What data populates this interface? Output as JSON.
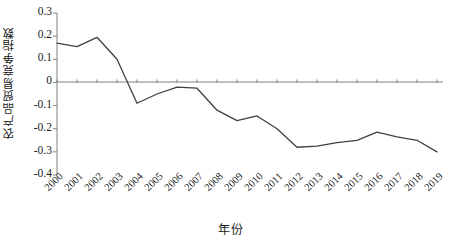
{
  "chart_data": {
    "type": "line",
    "title": "",
    "subtitle": "",
    "xlabel": "年份",
    "ylabel": "农产品贸易竞争指数",
    "legend": [],
    "legend_position": "none",
    "grid": false,
    "xlim": [
      2000,
      2019
    ],
    "ylim": [
      -0.4,
      0.3
    ],
    "ytick_labels": [
      "0.3",
      "0.2",
      "0.1",
      "0",
      "-0.1",
      "-0.2",
      "-0.3",
      "-0.4"
    ],
    "ytick_values": [
      0.3,
      0.2,
      0.1,
      0,
      -0.1,
      -0.2,
      -0.3,
      -0.4
    ],
    "categories": [
      "2000",
      "2001",
      "2002",
      "2003",
      "2004",
      "2005",
      "2006",
      "2007",
      "2008",
      "2009",
      "2010",
      "2011",
      "2012",
      "2013",
      "2014",
      "2015",
      "2016",
      "2017",
      "2018",
      "2019"
    ],
    "x": [
      2000,
      2001,
      2002,
      2003,
      2004,
      2005,
      2006,
      2007,
      2008,
      2009,
      2010,
      2011,
      2012,
      2013,
      2014,
      2015,
      2016,
      2017,
      2018,
      2019
    ],
    "values": [
      0.17,
      0.155,
      0.195,
      0.1,
      -0.09,
      -0.05,
      -0.02,
      -0.025,
      -0.12,
      -0.165,
      -0.145,
      -0.2,
      -0.28,
      -0.275,
      -0.26,
      -0.25,
      -0.215,
      -0.235,
      -0.25,
      -0.3
    ],
    "series": [
      {
        "name": "农产品贸易竞争指数",
        "values": [
          0.17,
          0.155,
          0.195,
          0.1,
          -0.09,
          -0.05,
          -0.02,
          -0.025,
          -0.12,
          -0.165,
          -0.145,
          -0.2,
          -0.28,
          -0.275,
          -0.26,
          -0.25,
          -0.215,
          -0.235,
          -0.25,
          -0.3
        ],
        "color": "#404040"
      }
    ],
    "annotations": []
  },
  "style": {
    "line_color": "#404040",
    "axis_color": "#808080",
    "text_color": "#1a1a1a",
    "background": "#ffffff"
  }
}
